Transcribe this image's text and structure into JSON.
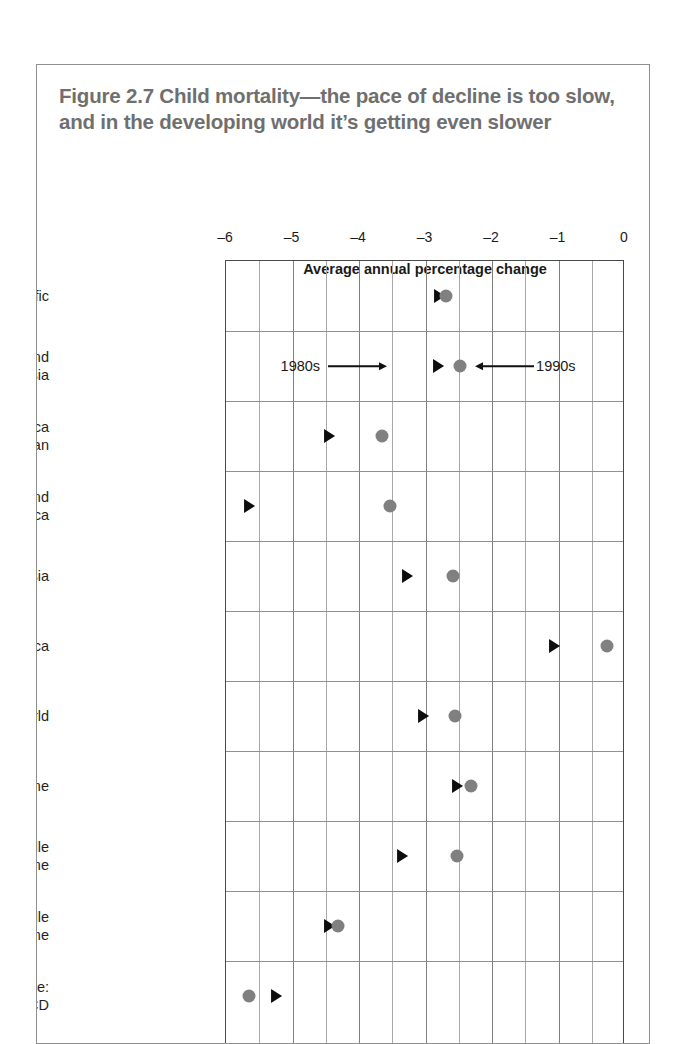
{
  "figure": {
    "title": "Figure 2.7  Child mortality—the pace of decline is too slow, and in the developing world it’s getting even slower"
  },
  "annotations": {
    "label_1980s": "1980s",
    "label_1990s": "1990s"
  },
  "colors": {
    "circle_1990s": "#808080",
    "triangle_1980s": "#0d0d0d",
    "title": "#6f6f6f",
    "frame": "#4a4a4a",
    "grid": "#909090"
  },
  "chart_data": {
    "type": "scatter",
    "title": "Figure 2.7  Child mortality—the pace of decline is too slow, and in the developing world it’s getting even slower",
    "xlabel": "Average annual percentage change",
    "ylabel": "",
    "xlim": [
      -6,
      0
    ],
    "xticks": [
      -6,
      -5,
      -4,
      -3,
      -2,
      -1,
      0
    ],
    "xticklabels": [
      "–6",
      "–5",
      "–4",
      "–3",
      "–2",
      "–1",
      "0"
    ],
    "minor_xticks": [
      -5.5,
      -4.5,
      -3.5,
      -2.5,
      -1.5,
      -0.5
    ],
    "grid": true,
    "legend": "inline-annotation",
    "categories": [
      "East Asia and Pacific",
      "Europe and\nCentral Asia",
      "Latin America\nand the Caribbean",
      "Middle East and\nNorth Africa",
      "South Asia",
      "Sub-Saharan Africa",
      "Developing world",
      "Low income",
      "Lower middle\nincome",
      "Upper middle\nincome",
      "High income:\nnon-OECD"
    ],
    "series": [
      {
        "name": "1980s",
        "marker": "triangle",
        "color": "#0d0d0d",
        "values": [
          -2.8,
          -2.81,
          -4.45,
          -5.65,
          -3.28,
          -1.07,
          -3.04,
          -2.53,
          -3.36,
          -4.45,
          -5.25
        ]
      },
      {
        "name": "1990s",
        "marker": "circle",
        "color": "#808080",
        "values": [
          -2.69,
          -2.48,
          -3.65,
          -3.53,
          -2.58,
          -0.27,
          -2.55,
          -2.32,
          -2.53,
          -4.32,
          -5.65
        ]
      }
    ]
  }
}
